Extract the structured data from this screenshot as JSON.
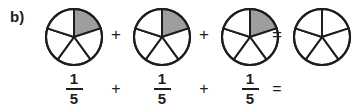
{
  "problem": {
    "label": "b)",
    "kind": "fraction-addition-pie-model"
  },
  "colors": {
    "shaded_slice": "#9e9e9e",
    "outline": "#1d1d1d",
    "unshaded_slice": "#ffffff",
    "background": "#ffffff",
    "text": "#1d1d1d"
  },
  "pies": [
    {
      "name": "pie-1",
      "slices_total": 5,
      "slices_shaded": 1,
      "shaded_indices": [
        0
      ],
      "start_angle_deg": 0,
      "fraction": "1/5"
    },
    {
      "name": "pie-2",
      "slices_total": 5,
      "slices_shaded": 1,
      "shaded_indices": [
        0
      ],
      "start_angle_deg": 0,
      "fraction": "1/5"
    },
    {
      "name": "pie-3",
      "slices_total": 5,
      "slices_shaded": 1,
      "shaded_indices": [
        0
      ],
      "start_angle_deg": 0,
      "fraction": "1/5"
    },
    {
      "name": "pie-answer",
      "slices_total": 5,
      "slices_shaded": 0,
      "shaded_indices": [],
      "start_angle_deg": 0,
      "fraction": ""
    }
  ],
  "top_row": {
    "operator_1": "+",
    "operator_2": "+",
    "operator_equals": "="
  },
  "equation": {
    "terms": [
      {
        "numerator": "1",
        "denominator": "5"
      },
      {
        "numerator": "1",
        "denominator": "5"
      },
      {
        "numerator": "1",
        "denominator": "5"
      }
    ],
    "operator_1": "+",
    "operator_2": "+",
    "operator_equals": "=",
    "answer_numerator": "",
    "answer_denominator": ""
  }
}
